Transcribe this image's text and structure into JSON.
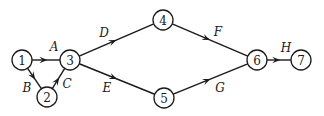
{
  "diagram": {
    "type": "activity-network",
    "nodes": [
      {
        "id": "1",
        "label": "1",
        "x": 22,
        "y": 60
      },
      {
        "id": "2",
        "label": "2",
        "x": 47,
        "y": 97
      },
      {
        "id": "3",
        "label": "3",
        "x": 70,
        "y": 60
      },
      {
        "id": "4",
        "label": "4",
        "x": 163,
        "y": 20
      },
      {
        "id": "5",
        "label": "5",
        "x": 164,
        "y": 98
      },
      {
        "id": "6",
        "label": "6",
        "x": 257,
        "y": 60
      },
      {
        "id": "7",
        "label": "7",
        "x": 301,
        "y": 60
      }
    ],
    "edges": [
      {
        "from": "1",
        "to": "3",
        "label": "A",
        "lx": 54,
        "ly": 47
      },
      {
        "from": "1",
        "to": "2",
        "label": "B",
        "lx": 27,
        "ly": 88
      },
      {
        "from": "2",
        "to": "3",
        "label": "C",
        "lx": 67,
        "ly": 84
      },
      {
        "from": "3",
        "to": "4",
        "label": "D",
        "lx": 104,
        "ly": 33
      },
      {
        "from": "3",
        "to": "5",
        "label": "E",
        "lx": 107,
        "ly": 88
      },
      {
        "from": "4",
        "to": "6",
        "label": "F",
        "lx": 218,
        "ly": 32
      },
      {
        "from": "5",
        "to": "6",
        "label": "G",
        "lx": 220,
        "ly": 88
      },
      {
        "from": "6",
        "to": "7",
        "label": "H",
        "lx": 286,
        "ly": 48
      }
    ],
    "node_radius": 10
  }
}
